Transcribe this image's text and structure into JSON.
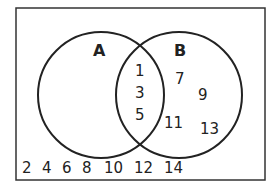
{
  "diagram": {
    "type": "venn",
    "sets": {
      "A": {
        "label": "A"
      },
      "B": {
        "label": "B"
      }
    },
    "intersection": [
      "1",
      "3",
      "5"
    ],
    "b_only": [
      "7",
      "9",
      "11",
      "13"
    ],
    "a_only": [],
    "outside": [
      "2",
      "4",
      "6",
      "8",
      "10",
      "12",
      "14"
    ]
  }
}
